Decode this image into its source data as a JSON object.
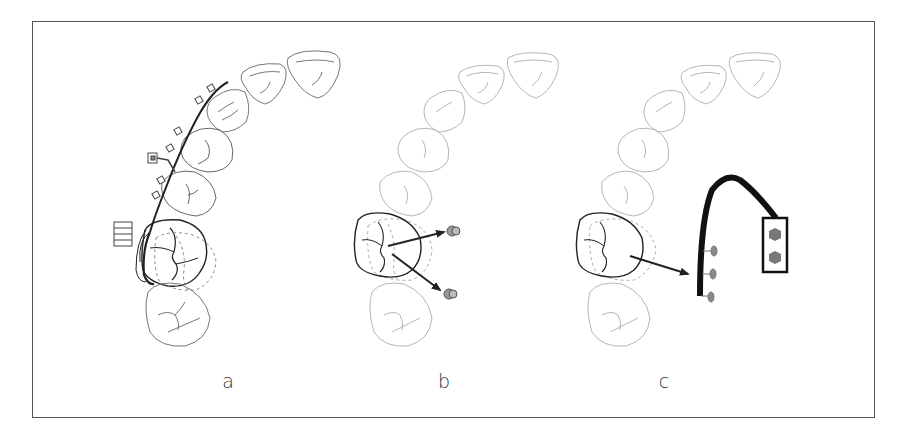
{
  "figure": {
    "type": "dental-arch-diagram",
    "panels": [
      {
        "id": "a",
        "label": "a",
        "description": "Upper arch with buccal wire appliance, brackets, molar band with tube and hook; first molar shown with dashed outlines of movement"
      },
      {
        "id": "b",
        "label": "b",
        "description": "Molar with two arrows pointing to two miniscrews (anchorage)"
      },
      {
        "id": "c",
        "label": "c",
        "description": "Molar with arrow pointing to a curved appliance bar with three pins and a plate with two hexagonal screws"
      }
    ],
    "colors": {
      "frame": "#555555",
      "faint_outline": "#b5b5b5",
      "outline": "#777777",
      "bold_outline": "#222222",
      "screw_fill": "#8a8a8a",
      "arrow": "#222222"
    }
  }
}
